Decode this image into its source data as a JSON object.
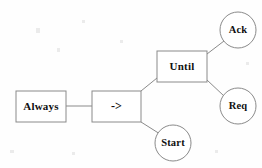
{
  "diagram": {
    "type": "tree",
    "title": "",
    "background_color": "#fefefe",
    "stroke_color": "#8a8a8a",
    "text_color": "#101010",
    "nodes": [
      {
        "id": "always",
        "label": "Always",
        "shape": "rectangle",
        "x": 16,
        "y": 91,
        "width": 50,
        "height": 31
      },
      {
        "id": "arrow",
        "label": "->",
        "shape": "rectangle",
        "x": 92,
        "y": 91,
        "width": 49,
        "height": 31
      },
      {
        "id": "until",
        "label": "Until",
        "shape": "rectangle",
        "x": 157,
        "y": 51,
        "width": 50,
        "height": 31
      },
      {
        "id": "ack",
        "label": "Ack",
        "shape": "circle",
        "cx": 238,
        "cy": 30,
        "r": 18
      },
      {
        "id": "req",
        "label": "Req",
        "shape": "circle",
        "cx": 238,
        "cy": 106,
        "r": 18
      },
      {
        "id": "start",
        "label": "Start",
        "shape": "circle",
        "cx": 173,
        "cy": 143,
        "r": 18
      }
    ],
    "edges": [
      {
        "id": "always-arrow",
        "from": "always",
        "to": "arrow",
        "x1": 66,
        "y1": 106,
        "x2": 92,
        "y2": 106
      },
      {
        "id": "arrow-until",
        "from": "arrow",
        "to": "until",
        "x1": 141,
        "y1": 91,
        "x2": 157,
        "y2": 78
      },
      {
        "id": "arrow-start",
        "from": "arrow",
        "to": "start",
        "x1": 141,
        "y1": 122,
        "x2": 160,
        "y2": 134
      },
      {
        "id": "until-ack",
        "from": "until",
        "to": "ack",
        "x1": 207,
        "y1": 54,
        "x2": 224,
        "y2": 41
      },
      {
        "id": "until-req",
        "from": "until",
        "to": "req",
        "x1": 207,
        "y1": 80,
        "x2": 224,
        "y2": 96
      }
    ]
  }
}
